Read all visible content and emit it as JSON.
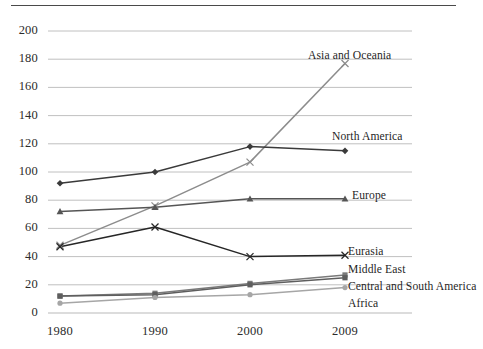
{
  "chart_data": {
    "type": "line",
    "title": "",
    "subtitle": "",
    "xlabel": "",
    "ylabel": "",
    "x": [
      "1980",
      "1990",
      "2000",
      "2009"
    ],
    "categories": [
      "1980",
      "1990",
      "2000",
      "2009"
    ],
    "xtick_labels": [
      "1980",
      "1990",
      "2000",
      "2009"
    ],
    "ytick_labels": [
      "0",
      "20",
      "40",
      "60",
      "80",
      "100",
      "120",
      "140",
      "160",
      "180",
      "200"
    ],
    "ylim": [
      0,
      200
    ],
    "ytick_step": 20,
    "grid": "horizontal",
    "legend": "inline-end-labels",
    "series": [
      {
        "name": "Asia and Oceania",
        "values": [
          48,
          76,
          107,
          177
        ],
        "color": "#8c8c8c",
        "marker": "x",
        "label_x": 308,
        "label_y": 50
      },
      {
        "name": "North America",
        "values": [
          92,
          100,
          118,
          115
        ],
        "color": "#3a3a3a",
        "marker": "diamond",
        "label_x": 332,
        "label_y": 131
      },
      {
        "name": "Europe",
        "values": [
          72,
          75,
          81,
          81
        ],
        "color": "#555555",
        "marker": "triangle",
        "label_x": 352,
        "label_y": 190
      },
      {
        "name": "Eurasia",
        "values": [
          47,
          61,
          40,
          41
        ],
        "color": "#262626",
        "marker": "x",
        "label_x": 348,
        "label_y": 246
      },
      {
        "name": "Middle East",
        "values": [
          12,
          14,
          21,
          27
        ],
        "color": "#7a7a7a",
        "marker": "square",
        "label_x": 348,
        "label_y": 264
      },
      {
        "name": "Central and South America",
        "values": [
          12,
          13,
          20,
          25
        ],
        "color": "#5e5e5e",
        "marker": "square",
        "label_x": 348,
        "label_y": 281
      },
      {
        "name": "Africa",
        "values": [
          7,
          11,
          13,
          18
        ],
        "color": "#a6a6a6",
        "marker": "circle",
        "label_x": 348,
        "label_y": 298
      }
    ]
  },
  "axes": {
    "y_pixel_zero": 313,
    "y_pixel_top": 31,
    "x_pixels": [
      60,
      155,
      250,
      345
    ],
    "plot_left": 48,
    "plot_right": 412,
    "gridline_color": "#b9b9b9",
    "axis_color": "#b9b9b9"
  },
  "decor": {
    "top_rule_color": "#4a4a4a"
  }
}
